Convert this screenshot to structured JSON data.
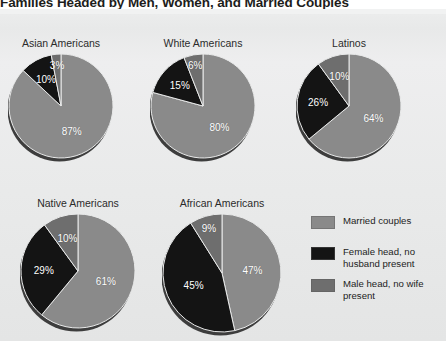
{
  "title": "Families Headed by Men, Women, and Married Couples",
  "colors": {
    "married": "#8a8a8a",
    "female_head": "#141414",
    "male_head": "#6e6e6e",
    "background": "#eaebeb",
    "label_text": "#2b2b2b",
    "value_text": "#ffffff"
  },
  "legend": {
    "items": [
      {
        "label": "Married couples",
        "color_key": "married"
      },
      {
        "label": "Female head, no husband present",
        "color_key": "female_head"
      },
      {
        "label": "Male head, no wife present",
        "color_key": "male_head"
      }
    ]
  },
  "chart_data": {
    "type": "pie",
    "title": "Families Headed by Men, Women, and Married Couples",
    "xlabel": "",
    "ylabel": "",
    "legend_position": "bottom-right",
    "grid": false,
    "units": "percent",
    "series_names": [
      "Married couples",
      "Female head, no husband present",
      "Male head, no wife present"
    ],
    "charts": [
      {
        "title": "Asian Americans",
        "labels": [
          "Married couples",
          "Female head, no husband present",
          "Male head, no wife present"
        ],
        "values": [
          87,
          10,
          3
        ],
        "value_labels": [
          "87%",
          "10%",
          "3%"
        ]
      },
      {
        "title": "White Americans",
        "labels": [
          "Married couples",
          "Female head, no husband present",
          "Male head, no wife present"
        ],
        "values": [
          80,
          15,
          6
        ],
        "value_labels": [
          "80%",
          "15%",
          "6%"
        ]
      },
      {
        "title": "Latinos",
        "labels": [
          "Married couples",
          "Female head, no husband present",
          "Male head, no wife present"
        ],
        "values": [
          64,
          26,
          10
        ],
        "value_labels": [
          "64%",
          "26%",
          "10%"
        ]
      },
      {
        "title": "Native Americans",
        "labels": [
          "Married couples",
          "Female head, no husband present",
          "Male head, no wife present"
        ],
        "values": [
          61,
          29,
          10
        ],
        "value_labels": [
          "61%",
          "29%",
          "10%"
        ]
      },
      {
        "title": "African Americans",
        "labels": [
          "Married couples",
          "Female head, no husband present",
          "Male head, no wife present"
        ],
        "values": [
          47,
          45,
          9
        ],
        "value_labels": [
          "47%",
          "45%",
          "9%"
        ]
      }
    ]
  },
  "layout": {
    "charts": [
      {
        "left": 8,
        "top": 28,
        "size": 106,
        "label_gap": 16
      },
      {
        "left": 150,
        "top": 28,
        "size": 106,
        "label_gap": 16
      },
      {
        "left": 296,
        "top": 28,
        "size": 106,
        "label_gap": 16
      },
      {
        "left": 20,
        "top": 188,
        "size": 116,
        "label_gap": 16
      },
      {
        "left": 162,
        "top": 188,
        "size": 120,
        "label_gap": 16
      }
    ]
  }
}
